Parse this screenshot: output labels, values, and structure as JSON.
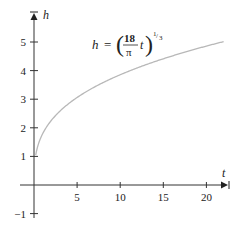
{
  "chart_data": {
    "type": "line",
    "title": "",
    "xlabel": "t",
    "ylabel": "h",
    "xlim": [
      0,
      22
    ],
    "ylim": [
      -1,
      5.6
    ],
    "grid": false,
    "x_ticks": [
      5,
      10,
      15,
      20
    ],
    "y_ticks": [
      -1,
      1,
      2,
      3,
      4,
      5
    ],
    "x_tick_labels": [
      "5",
      "10",
      "15",
      "20"
    ],
    "y_tick_labels": [
      "−1",
      "1",
      "2",
      "3",
      "4",
      "5"
    ],
    "annotation": {
      "lhs": "h",
      "equals": "=",
      "numerator": "18",
      "denominator": "π",
      "variable": "t",
      "exponent_num": "1",
      "exponent_den": "3"
    },
    "series": [
      {
        "name": "h = (18t/π)^(1/3)",
        "color": "#b8b8b8",
        "x": [
          0.2,
          0.5,
          1,
          2,
          3,
          4,
          5,
          6,
          8,
          10,
          12,
          14,
          16,
          18,
          20,
          22
        ],
        "y": [
          1.05,
          1.42,
          1.79,
          2.25,
          2.58,
          2.84,
          3.06,
          3.25,
          3.58,
          3.86,
          4.1,
          4.31,
          4.51,
          4.69,
          4.86,
          5.01
        ]
      }
    ]
  }
}
